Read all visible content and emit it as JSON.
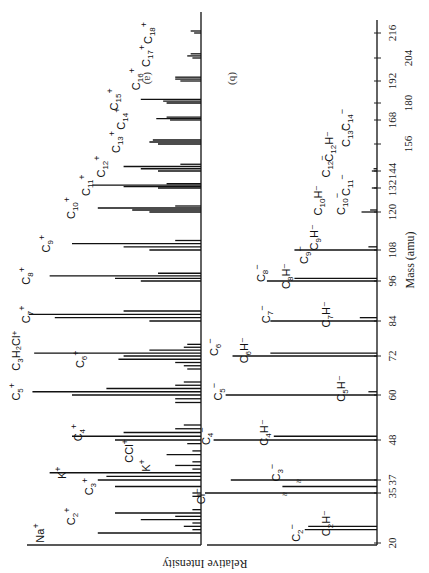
{
  "figure": {
    "orientation": "rotated 90 degrees clockwise",
    "panel_a_label": "(a)",
    "panel_b_label": "(b)",
    "x_axis_title": "Mass (amu)",
    "y_axis_title": "Relative Intensity"
  },
  "chart_data": [
    {
      "type": "bar",
      "title": "(a) Positive ions",
      "xlabel": "Mass (amu)",
      "ylabel": "Relative Intensity",
      "x_ticks": [
        20,
        35,
        37,
        48,
        60,
        72,
        84,
        96,
        108,
        120,
        132,
        144,
        156,
        168,
        180,
        192,
        204,
        216
      ],
      "xlim": [
        20,
        216
      ],
      "grid": false,
      "peaks": [
        {
          "mass": 23,
          "intensity": 0.6,
          "label": "Na+"
        },
        {
          "mass": 24,
          "intensity": 0.05
        },
        {
          "mass": 25,
          "intensity": 0.1
        },
        {
          "mass": 26,
          "intensity": 0.05
        },
        {
          "mass": 27,
          "intensity": 0.35
        },
        {
          "mass": 28,
          "intensity": 0.15
        },
        {
          "mass": 29,
          "intensity": 0.5,
          "label": "C2+"
        },
        {
          "mass": 30,
          "intensity": 0.05
        },
        {
          "mass": 34,
          "intensity": 0.05
        },
        {
          "mass": 35,
          "intensity": 0.05
        },
        {
          "mass": 36,
          "intensity": 0.5,
          "label": "C3+"
        },
        {
          "mass": 37,
          "intensity": 0.6
        },
        {
          "mass": 38,
          "intensity": 0.55
        },
        {
          "mass": 39,
          "intensity": 0.88,
          "label": "K+"
        },
        {
          "mass": 40,
          "intensity": 0.05
        },
        {
          "mass": 41,
          "intensity": 0.15,
          "label": "K+ (41)"
        },
        {
          "mass": 42,
          "intensity": 0.05
        },
        {
          "mass": 44,
          "intensity": 0.2
        },
        {
          "mass": 45,
          "intensity": 0.05
        },
        {
          "mass": 47,
          "intensity": 0.08,
          "label": "CCl+"
        },
        {
          "mass": 48,
          "intensity": 0.5,
          "label": "C4+"
        },
        {
          "mass": 49,
          "intensity": 0.75
        },
        {
          "mass": 50,
          "intensity": 0.45
        },
        {
          "mass": 51,
          "intensity": 0.15
        },
        {
          "mass": 52,
          "intensity": 0.1
        },
        {
          "mass": 58,
          "intensity": 0.15
        },
        {
          "mass": 59,
          "intensity": 0.15
        },
        {
          "mass": 60,
          "intensity": 0.75,
          "label": "C5+"
        },
        {
          "mass": 61,
          "intensity": 0.98
        },
        {
          "mass": 62,
          "intensity": 0.55
        },
        {
          "mass": 63,
          "intensity": 0.15
        },
        {
          "mass": 64,
          "intensity": 0.1
        },
        {
          "mass": 68,
          "intensity": 0.08
        },
        {
          "mass": 69,
          "intensity": 0.1
        },
        {
          "mass": 70,
          "intensity": 0.15,
          "label": "C6+"
        },
        {
          "mass": 71,
          "intensity": 0.48
        },
        {
          "mass": 72,
          "intensity": 0.45
        },
        {
          "mass": 73,
          "intensity": 0.97,
          "label": "C3H2Cl+"
        },
        {
          "mass": 74,
          "intensity": 0.3
        },
        {
          "mass": 75,
          "intensity": 0.1
        },
        {
          "mass": 76,
          "intensity": 0.08
        },
        {
          "mass": 84,
          "intensity": 0.3,
          "label": "C7+"
        },
        {
          "mass": 85,
          "intensity": 0.85
        },
        {
          "mass": 86,
          "intensity": 1.0
        },
        {
          "mass": 87,
          "intensity": 0.45
        },
        {
          "mass": 96,
          "intensity": 0.35,
          "label": "C8+"
        },
        {
          "mass": 97,
          "intensity": 0.5
        },
        {
          "mass": 98,
          "intensity": 0.88
        },
        {
          "mass": 99,
          "intensity": 0.25
        },
        {
          "mass": 108,
          "intensity": 0.3,
          "label": "C9+"
        },
        {
          "mass": 109,
          "intensity": 0.45
        },
        {
          "mass": 110,
          "intensity": 0.75
        },
        {
          "mass": 111,
          "intensity": 0.15
        },
        {
          "mass": 120,
          "intensity": 0.3,
          "label": "C10+"
        },
        {
          "mass": 121,
          "intensity": 0.4
        },
        {
          "mass": 122,
          "intensity": 0.6
        },
        {
          "mass": 123,
          "intensity": 0.15
        },
        {
          "mass": 132,
          "intensity": 0.25,
          "label": "C11+"
        },
        {
          "mass": 133,
          "intensity": 0.45
        },
        {
          "mass": 134,
          "intensity": 0.63
        },
        {
          "mass": 135,
          "intensity": 0.2
        },
        {
          "mass": 144,
          "intensity": 0.25,
          "label": "C12+"
        },
        {
          "mass": 145,
          "intensity": 0.35
        },
        {
          "mass": 146,
          "intensity": 0.45
        },
        {
          "mass": 147,
          "intensity": 0.12
        },
        {
          "mass": 156,
          "intensity": 0.25,
          "label": "C13+"
        },
        {
          "mass": 157,
          "intensity": 0.3
        },
        {
          "mass": 158,
          "intensity": 0.28
        },
        {
          "mass": 168,
          "intensity": 0.18,
          "label": "C14+"
        },
        {
          "mass": 169,
          "intensity": 0.26
        },
        {
          "mass": 170,
          "intensity": 0.2
        },
        {
          "mass": 180,
          "intensity": 0.2,
          "label": "C15+"
        },
        {
          "mass": 181,
          "intensity": 0.22
        },
        {
          "mass": 182,
          "intensity": 0.35
        },
        {
          "mass": 192,
          "intensity": 0.12,
          "label": "C16+"
        },
        {
          "mass": 193,
          "intensity": 0.15
        },
        {
          "mass": 194,
          "intensity": 0.15
        },
        {
          "mass": 204,
          "intensity": 0.05,
          "label": "C17+"
        },
        {
          "mass": 205,
          "intensity": 0.08
        },
        {
          "mass": 206,
          "intensity": 0.06
        },
        {
          "mass": 216,
          "intensity": 0.04,
          "label": "C18+"
        },
        {
          "mass": 217,
          "intensity": 0.06
        }
      ]
    },
    {
      "type": "bar",
      "title": "(b) Negative ions",
      "xlabel": "Mass (amu)",
      "ylabel": "Relative Intensity",
      "x_ticks": [
        20,
        35,
        37,
        48,
        60,
        72,
        84,
        96,
        108,
        120,
        132,
        144,
        156,
        168,
        180,
        192,
        204,
        216
      ],
      "xlim": [
        20,
        216
      ],
      "grid": false,
      "axis_break": "Cl- peaks at 35/37 truncated (≈ marks)",
      "peaks": [
        {
          "mass": 24,
          "intensity": 0.42,
          "label": "C2-"
        },
        {
          "mass": 25,
          "intensity": 0.4,
          "label": "C2H-"
        },
        {
          "mass": 35,
          "intensity": 1.0,
          "label": "Cl-",
          "truncated": true
        },
        {
          "mass": 36,
          "intensity": 0.55,
          "label": "C3-"
        },
        {
          "mass": 37,
          "intensity": 0.85,
          "truncated": true
        },
        {
          "mass": 48,
          "intensity": 0.95,
          "label": "C4-"
        },
        {
          "mass": 49,
          "intensity": 0.6,
          "label": "C4H-"
        },
        {
          "mass": 60,
          "intensity": 0.88,
          "label": "C5-"
        },
        {
          "mass": 61,
          "intensity": 0.05,
          "label": "C5H-"
        },
        {
          "mass": 72,
          "intensity": 0.84,
          "label": "C6-"
        },
        {
          "mass": 73,
          "intensity": 0.62,
          "label": "C6H-"
        },
        {
          "mass": 84,
          "intensity": 0.62,
          "label": "C7-"
        },
        {
          "mass": 85,
          "intensity": 0.1,
          "label": "C7H-"
        },
        {
          "mass": 96,
          "intensity": 0.64,
          "label": "C8-"
        },
        {
          "mass": 97,
          "intensity": 0.48,
          "label": "C8H-"
        },
        {
          "mass": 108,
          "intensity": 0.48,
          "label": "C9-"
        },
        {
          "mass": 109,
          "intensity": 0.05,
          "label": "C9H-"
        },
        {
          "mass": 120,
          "intensity": 0.09,
          "label": "C10-"
        },
        {
          "mass": 121,
          "intensity": 0.04,
          "label": "C10H-"
        },
        {
          "mass": 132,
          "intensity": 0.03,
          "label": "C11-"
        },
        {
          "mass": 144,
          "intensity": 0.03,
          "label": "C12-"
        },
        {
          "mass": 145,
          "intensity": 0.02,
          "label": "C12H-"
        },
        {
          "mass": 156,
          "intensity": 0.0,
          "label": "C13-"
        },
        {
          "mass": 168,
          "intensity": 0.0,
          "label": "C14-"
        }
      ]
    }
  ],
  "layout": {
    "axis_ticks_px": [
      [
        20,
        543
      ],
      [
        35,
        493
      ],
      [
        37,
        480
      ],
      [
        48,
        440
      ],
      [
        60,
        395
      ],
      [
        72,
        356
      ],
      [
        84,
        321
      ],
      [
        96,
        281
      ],
      [
        108,
        250
      ],
      [
        120,
        212
      ],
      [
        132,
        188
      ],
      [
        144,
        171
      ],
      [
        156,
        144
      ],
      [
        168,
        120
      ],
      [
        180,
        103
      ],
      [
        192,
        81
      ],
      [
        204,
        58
      ],
      [
        216,
        33
      ]
    ],
    "labels_a": [
      {
        "text": "Na",
        "sup": "+",
        "sub": "",
        "mass": 23,
        "x": 44
      },
      {
        "text": "C",
        "sub": "2",
        "sup": "+",
        "mass": 28,
        "x": 75
      },
      {
        "text": "C",
        "sub": "3",
        "sup": "+",
        "mass": 36,
        "x": 93
      },
      {
        "text": "K",
        "sub": "",
        "sup": "+",
        "mass": 39,
        "x": 66
      },
      {
        "text": "K",
        "sub": "",
        "sup": "+",
        "mass": 41,
        "x": 150
      },
      {
        "text": "CCl",
        "sub": "",
        "sup": "+",
        "mass": 45,
        "x": 133
      },
      {
        "text": "C",
        "sub": "4",
        "sup": "+",
        "mass": 50,
        "x": 82
      },
      {
        "text": "C",
        "sub": "5",
        "sup": "+",
        "mass": 61,
        "x": 20
      },
      {
        "text": "C",
        "sub": "3",
        "sup": "",
        "extra": "H₂Cl⁺",
        "mass": 74,
        "x": 20
      },
      {
        "text": "C",
        "sub": "6",
        "sup": "+",
        "mass": 71,
        "x": 84
      },
      {
        "text": "C",
        "sub": "7",
        "sup": "+",
        "mass": 86,
        "x": 30
      },
      {
        "text": "C",
        "sub": "8",
        "sup": "+",
        "mass": 98,
        "x": 30
      },
      {
        "text": "C",
        "sub": "9",
        "sup": "+",
        "mass": 110,
        "x": 50
      },
      {
        "text": "C",
        "sub": "10",
        "sup": "+",
        "mass": 122,
        "x": 75
      },
      {
        "text": "C",
        "sub": "11",
        "sup": "+",
        "mass": 134,
        "x": 90
      },
      {
        "text": "C",
        "sub": "12",
        "sup": "+",
        "mass": 146,
        "x": 105
      },
      {
        "text": "C",
        "sub": "13",
        "sup": "+",
        "mass": 157,
        "x": 120
      },
      {
        "text": "C",
        "sub": "14",
        "sup": "+",
        "mass": 169,
        "x": 125
      },
      {
        "text": "C",
        "sub": "15",
        "sup": "+",
        "mass": 182,
        "x": 118
      },
      {
        "text": "C",
        "sub": "16",
        "sup": "+",
        "mass": 193,
        "x": 140
      },
      {
        "text": "C",
        "sub": "17",
        "sup": "+",
        "mass": 205,
        "x": 150
      },
      {
        "text": "C",
        "sub": "18",
        "sup": "+",
        "mass": 216,
        "x": 152
      }
    ],
    "labels_b": [
      {
        "text": "C",
        "sub": "2",
        "sup": "−",
        "mass": 23,
        "x": 300
      },
      {
        "text": "C",
        "sub": "2",
        "sup": "",
        "extra": "H⁻",
        "mass": 26,
        "x": 330
      },
      {
        "text": "Cl",
        "sub": "",
        "sup": "−",
        "mass": 34,
        "x": 205
      },
      {
        "text": "C",
        "sub": "3",
        "sup": "−",
        "mass": 39,
        "x": 280
      },
      {
        "text": "C",
        "sub": "4",
        "sup": "−",
        "mass": 49,
        "x": 210
      },
      {
        "text": "C",
        "sub": "4",
        "sup": "",
        "extra": "H⁻",
        "mass": 50,
        "x": 268
      },
      {
        "text": "C",
        "sub": "5",
        "sup": "−",
        "mass": 61,
        "x": 222
      },
      {
        "text": "C",
        "sub": "5",
        "sup": "",
        "extra": "H⁻",
        "mass": 62,
        "x": 345
      },
      {
        "text": "C",
        "sub": "6",
        "sup": "−",
        "mass": 75,
        "x": 218
      },
      {
        "text": "C",
        "sub": "6",
        "sup": "",
        "extra": "H⁻",
        "mass": 74,
        "x": 248
      },
      {
        "text": "C",
        "sub": "7",
        "sup": "−",
        "mass": 86,
        "x": 270
      },
      {
        "text": "C",
        "sub": "7",
        "sup": "",
        "extra": "H⁻",
        "mass": 86,
        "x": 330
      },
      {
        "text": "C",
        "sub": "8",
        "sup": "−",
        "mass": 99,
        "x": 265
      },
      {
        "text": "C",
        "sub": "8",
        "sup": "",
        "extra": "H⁻",
        "mass": 98,
        "x": 290
      },
      {
        "text": "C",
        "sub": "9",
        "sup": "−",
        "mass": 106,
        "x": 308
      },
      {
        "text": "C",
        "sub": "9",
        "sup": "",
        "extra": "H⁻",
        "mass": 112,
        "x": 318
      },
      {
        "text": "C",
        "sub": "10",
        "sup": "−",
        "mass": 124,
        "x": 345
      },
      {
        "text": "C",
        "sub": "10",
        "sup": "",
        "extra": "H⁻",
        "mass": 126,
        "x": 322
      },
      {
        "text": "C",
        "sub": "11",
        "sup": "−",
        "mass": 134,
        "x": 350
      },
      {
        "text": "C",
        "sub": "12",
        "sup": "−",
        "mass": 146,
        "x": 330
      },
      {
        "text": "C",
        "sub": "12",
        "sup": "",
        "extra": "H⁻",
        "mass": 155,
        "x": 333
      },
      {
        "text": "C",
        "sub": "13",
        "sup": "−",
        "mass": 160,
        "x": 350
      },
      {
        "text": "C",
        "sub": "14",
        "sup": "−",
        "mass": 168,
        "x": 350
      }
    ]
  }
}
